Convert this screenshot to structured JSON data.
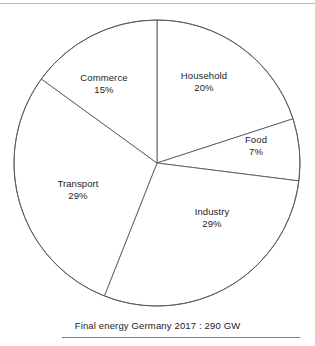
{
  "chart_data": {
    "type": "pie",
    "title": "Final energy Germany 2017 : 290 GW",
    "xlabel": "",
    "ylabel": "",
    "total_label": "290 GW",
    "year": "2017",
    "region": "Germany",
    "categories": [
      "Household",
      "Food",
      "Industry",
      "Transport",
      "Commerce"
    ],
    "values": [
      20,
      7,
      29,
      29,
      15
    ],
    "value_suffix": "%",
    "legend": "none",
    "grid": false,
    "start_angle_deg": 0,
    "direction": "clockwise",
    "slices": [
      {
        "label": "Household",
        "value": 20,
        "value_text": "20%",
        "start_deg": 0,
        "end_deg": 72,
        "label_x": 204,
        "label_y": 82
      },
      {
        "label": "Food",
        "value": 7,
        "value_text": "7%",
        "start_deg": 72,
        "end_deg": 97.2,
        "label_x": 256,
        "label_y": 146
      },
      {
        "label": "Industry",
        "value": 29,
        "value_text": "29%",
        "start_deg": 97.2,
        "end_deg": 201.6,
        "label_x": 212,
        "label_y": 218
      },
      {
        "label": "Transport",
        "value": 29,
        "value_text": "29%",
        "start_deg": 201.6,
        "end_deg": 306,
        "label_x": 78,
        "label_y": 190
      },
      {
        "label": "Commerce",
        "value": 15,
        "value_text": "15%",
        "start_deg": 306,
        "end_deg": 360,
        "label_x": 104,
        "label_y": 84
      }
    ]
  },
  "caption": {
    "text": "Final energy Germany 2017 : 290 GW"
  },
  "colors": {
    "slice_fill": "#ffffff",
    "slice_stroke": "#5a5a5e",
    "text": "#1c1c1c",
    "rule": "#7c7c80",
    "top_rule": "#b9b9bd",
    "background": "#ffffff"
  },
  "geometry": {
    "center_x": 157,
    "center_y": 163,
    "radius": 143
  }
}
